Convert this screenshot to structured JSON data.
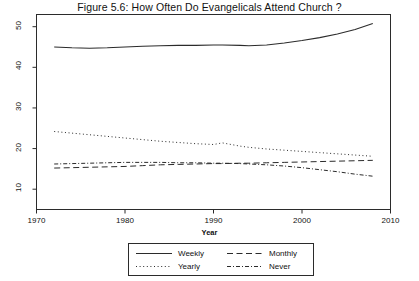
{
  "chart_data": {
    "type": "line",
    "title": "Figure 5.6: How Often Do Evangelicals Attend Church ?",
    "xlabel": "Year",
    "ylabel": "% of Evangelicals",
    "xlim": [
      1970,
      2010
    ],
    "ylim": [
      5,
      53
    ],
    "xticks": [
      1970,
      1980,
      1990,
      2000,
      2010
    ],
    "yticks": [
      10,
      20,
      30,
      40,
      50
    ],
    "grid": false,
    "legend_position": "below-plot",
    "x": [
      1972,
      1974,
      1976,
      1978,
      1980,
      1982,
      1984,
      1986,
      1988,
      1990,
      1991,
      1993,
      1994,
      1996,
      1998,
      2000,
      2002,
      2004,
      2006,
      2008
    ],
    "series": [
      {
        "name": "Weekly",
        "style": "solid",
        "values": [
          45.0,
          44.8,
          44.7,
          44.8,
          45.0,
          45.2,
          45.3,
          45.4,
          45.4,
          45.5,
          45.5,
          45.4,
          45.3,
          45.5,
          46.0,
          46.6,
          47.3,
          48.2,
          49.3,
          50.8
        ]
      },
      {
        "name": "Monthly",
        "style": "dashed",
        "values": [
          15.2,
          15.3,
          15.4,
          15.5,
          15.6,
          15.8,
          16.0,
          16.1,
          16.2,
          16.3,
          16.3,
          16.4,
          16.4,
          16.5,
          16.6,
          16.7,
          16.8,
          16.9,
          17.0,
          17.1
        ]
      },
      {
        "name": "Yearly",
        "style": "dotted",
        "values": [
          24.2,
          23.8,
          23.4,
          23.0,
          22.6,
          22.2,
          21.8,
          21.5,
          21.2,
          21.0,
          21.4,
          20.6,
          20.3,
          19.9,
          19.6,
          19.3,
          19.0,
          18.7,
          18.4,
          18.1
        ]
      },
      {
        "name": "Never",
        "style": "dash-dot",
        "values": [
          16.2,
          16.3,
          16.4,
          16.5,
          16.6,
          16.6,
          16.6,
          16.5,
          16.5,
          16.4,
          16.4,
          16.3,
          16.2,
          16.0,
          15.7,
          15.3,
          14.8,
          14.3,
          13.7,
          13.2
        ]
      }
    ]
  },
  "legend": {
    "items": [
      {
        "label": "Weekly",
        "style": "solid"
      },
      {
        "label": "Monthly",
        "style": "dashed"
      },
      {
        "label": "Yearly",
        "style": "dotted"
      },
      {
        "label": "Never",
        "style": "dash-dot"
      }
    ]
  },
  "colors": {
    "line": "#2b2b2b",
    "axis": "#2b2b2b",
    "text": "#111111",
    "background": "#ffffff"
  }
}
